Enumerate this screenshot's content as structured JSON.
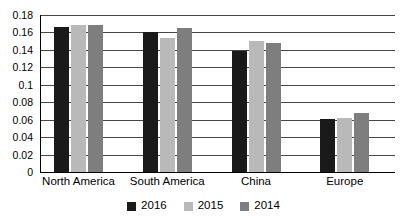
{
  "chart_data": {
    "type": "bar",
    "title": "",
    "subtitle": "",
    "xlabel": "",
    "ylabel": "",
    "categories": [
      "North America",
      "South America",
      "China",
      "Europe"
    ],
    "series": [
      {
        "name": "2016",
        "color": "#1a1a1a",
        "values": [
          0.166,
          0.16,
          0.139,
          0.061
        ]
      },
      {
        "name": "2015",
        "color": "#b9b9b9",
        "values": [
          0.168,
          0.154,
          0.15,
          0.062
        ]
      },
      {
        "name": "2014",
        "color": "#7e7e7e",
        "values": [
          0.169,
          0.165,
          0.148,
          0.068
        ]
      }
    ],
    "ylim": [
      0,
      0.18
    ],
    "ytick_values": [
      0,
      0.02,
      0.04,
      0.06,
      0.08,
      0.1,
      0.12,
      0.14,
      0.16,
      0.18
    ],
    "ytick_labels": [
      "0",
      "0.02",
      "0.04",
      "0.06",
      "0.08",
      "0.1",
      "0.12",
      "0.14",
      "0.16",
      "0.18"
    ],
    "grid": true,
    "grid_axis": "y",
    "legend_position": "bottom",
    "background_color": "#ffffff",
    "axis_color": "#000000"
  }
}
